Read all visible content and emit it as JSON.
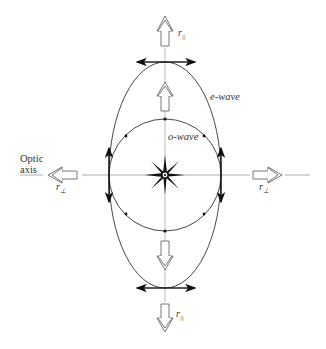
{
  "figure": {
    "labels": {
      "e_wave": "e-wave",
      "o_wave": "o-wave",
      "optic_axis_line1": "Optic",
      "optic_axis_line2": "axis",
      "r_parallel_top": "r",
      "r_parallel_top_sub": "||",
      "r_parallel_bottom": "r",
      "r_parallel_bottom_sub": "||",
      "r_perp_left": "r",
      "r_perp_left_sub": "⊥",
      "r_perp_right": "r",
      "r_perp_right_sub": "⊥"
    },
    "geometry": {
      "center": [
        165,
        175
      ],
      "o_wave_radius": 56,
      "e_wave_semi_axes": [
        56,
        113
      ]
    },
    "colors": {
      "line": "#222222",
      "axis": "#999999"
    }
  }
}
